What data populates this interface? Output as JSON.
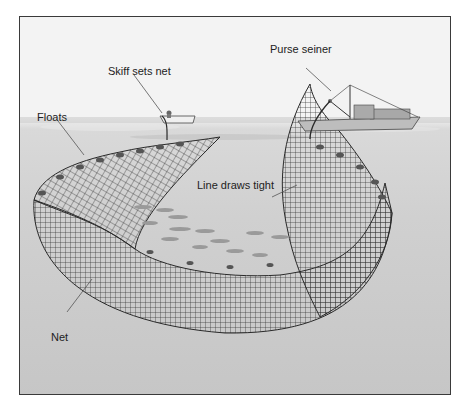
{
  "diagram": {
    "labels": {
      "purse_seiner": "Purse seiner",
      "skiff": "Skiff sets net",
      "floats": "Floats",
      "line": "Line draws tight",
      "net": "Net"
    },
    "colors": {
      "sky": "#f3f3f3",
      "water_surface": "#d9d9d9",
      "water_deep": "#c6c6c6",
      "net_lines": "#2a2a2a",
      "floats": "#555555",
      "fish": "#9a9a9a",
      "frame": "#3a3a3a"
    }
  }
}
